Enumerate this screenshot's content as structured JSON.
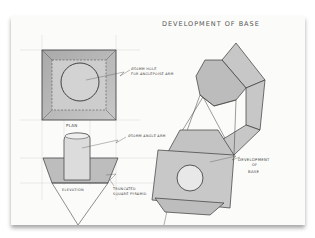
{
  "drawing": {
    "title": "Development of Base",
    "labels": {
      "plan": "Plan",
      "elevation": "Elevation",
      "hole_note_line1": "Ø50mm hole",
      "hole_note_line2": "for anglepoise arm",
      "arm_note": "Ø50mm angle arm",
      "frustum_note_line1": "Truncated",
      "frustum_note_line2": "square pyramid",
      "development_line1": "Development",
      "development_line2": "of",
      "development_line3": "Base"
    },
    "views": [
      "plan",
      "elevation",
      "development-net"
    ],
    "colors": {
      "paper": "#fbfbf9",
      "ink": "#3a3a3a",
      "shade": "#b9b9b9",
      "light_shade": "#d6d6d6"
    }
  }
}
